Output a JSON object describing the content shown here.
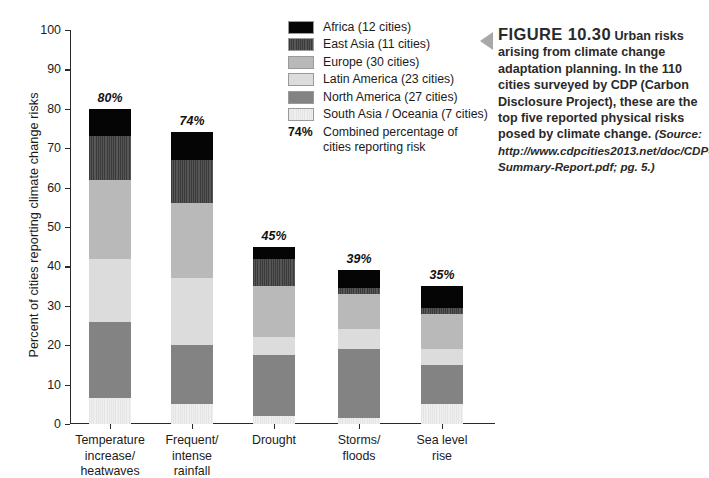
{
  "chart_data": {
    "type": "bar",
    "stacked": true,
    "title": "",
    "xlabel": "",
    "ylabel": "Percent of cities reporting climate change risks",
    "ylim": [
      0,
      100
    ],
    "yticks": [
      0,
      10,
      20,
      30,
      40,
      50,
      60,
      70,
      80,
      90,
      100
    ],
    "grid": false,
    "legend_position": "top-center",
    "categories": [
      "Temperature increase/ heatwaves",
      "Frequent/ intense rainfall",
      "Drought",
      "Storms/ floods",
      "Sea level rise"
    ],
    "category_lines": [
      [
        "Temperature",
        "increase/",
        "heatwaves"
      ],
      [
        "Frequent/",
        "intense",
        "rainfall"
      ],
      [
        "Drought"
      ],
      [
        "Storms/",
        "floods"
      ],
      [
        "Sea level",
        "rise"
      ]
    ],
    "series": [
      {
        "name": "South Asia / Oceania (7 cities)",
        "key": "south",
        "color": "#e9e9e9",
        "values": [
          6.5,
          5,
          2,
          1.5,
          5
        ]
      },
      {
        "name": "North America (27 cities)",
        "key": "north",
        "color": "#838383",
        "values": [
          19.5,
          15,
          15.5,
          17.5,
          10
        ]
      },
      {
        "name": "Latin America (23 cities)",
        "key": "latin",
        "color": "#dcdcdc",
        "values": [
          16,
          17,
          4.5,
          5,
          4
        ]
      },
      {
        "name": "Europe (30 cities)",
        "key": "europe",
        "color": "#b9b9b9",
        "values": [
          20,
          19,
          13,
          9,
          9
        ]
      },
      {
        "name": "East Asia (11 cities)",
        "key": "eastasia",
        "color": "#4a4a4a",
        "values": [
          11,
          11,
          7,
          1.5,
          1.5
        ]
      },
      {
        "name": "Africa (12 cities)",
        "key": "africa",
        "color": "#050505",
        "values": [
          7,
          7,
          3,
          4.5,
          5.5
        ]
      }
    ],
    "totals": [
      80,
      74,
      45,
      39,
      35
    ],
    "total_labels": [
      "80%",
      "74%",
      "45%",
      "39%",
      "35%"
    ]
  },
  "legend": {
    "entries": [
      {
        "label": "Africa (12 cities)",
        "fill_class": "fill-africa"
      },
      {
        "label": "East Asia (11 cities)",
        "fill_class": "fill-eastasia"
      },
      {
        "label": "Europe (30 cities)",
        "fill_class": "fill-europe"
      },
      {
        "label": "Latin America (23 cities)",
        "fill_class": "fill-latin"
      },
      {
        "label": "North America (27 cities)",
        "fill_class": "fill-north"
      },
      {
        "label": "South Asia / Oceania (7 cities)",
        "fill_class": "fill-south"
      }
    ],
    "note_pct": "74%",
    "note_text": "Combined percentage of cities reporting risk"
  },
  "caption": {
    "figure_number": "FIGURE 10.30",
    "body": "Urban risks arising from climate change adaptation planning. In the 110 cities surveyed by CDP (Carbon Disclosure Project), these are the top five reported physical risks posed by climate change.",
    "source": "(Source: http://www.cdpcities2013.net/doc/CDP-Summary-Report.pdf; pg. 5.)"
  }
}
